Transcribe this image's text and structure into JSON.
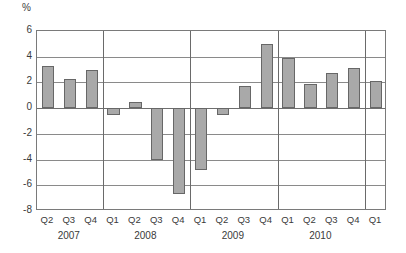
{
  "chart_data": {
    "type": "bar",
    "title": "",
    "subtitle": "",
    "xlabel": "",
    "ylabel": "%",
    "unit_label": "%",
    "ylim": [
      -8,
      6
    ],
    "ytick_step": 2,
    "yticks": [
      "6",
      "4",
      "2",
      "0",
      "-2",
      "-4",
      "-6",
      "-8"
    ],
    "ytick_values": [
      6,
      4,
      2,
      0,
      -2,
      -4,
      -6,
      -8
    ],
    "grid": true,
    "legend": "none",
    "categories": [
      "Q2",
      "Q3",
      "Q4",
      "Q1",
      "Q2",
      "Q3",
      "Q4",
      "Q1",
      "Q2",
      "Q3",
      "Q4",
      "Q1",
      "Q2",
      "Q3",
      "Q4",
      "Q1"
    ],
    "values": [
      3.3,
      2.3,
      3.0,
      -0.5,
      0.5,
      -4.0,
      -6.7,
      -4.8,
      -0.5,
      1.7,
      5.0,
      3.9,
      1.9,
      2.7,
      3.1,
      2.1
    ],
    "group_labels": [
      "2007",
      "2008",
      "2009",
      "2010"
    ],
    "groups": [
      {
        "year": "2007",
        "quarters": [
          "Q2",
          "Q3",
          "Q4"
        ],
        "values": [
          3.3,
          2.3,
          3.0
        ]
      },
      {
        "year": "2008",
        "quarters": [
          "Q1",
          "Q2",
          "Q3",
          "Q4"
        ],
        "values": [
          -0.5,
          0.5,
          -4.0,
          -6.7
        ]
      },
      {
        "year": "2009",
        "quarters": [
          "Q1",
          "Q2",
          "Q3",
          "Q4"
        ],
        "values": [
          -4.8,
          -0.5,
          1.7,
          5.0
        ]
      },
      {
        "year": "2010",
        "quarters": [
          "Q1",
          "Q2",
          "Q3",
          "Q4"
        ],
        "values": [
          3.9,
          1.9,
          2.7,
          3.1
        ]
      },
      {
        "year": "",
        "quarters": [
          "Q1"
        ],
        "values": [
          2.1
        ]
      }
    ],
    "colors": {
      "bar_fill": "#a9a9a9",
      "bar_border": "#676767",
      "gridline": "#8a8a8a",
      "frame": "#7a7a7a",
      "separator": "#6a6a6a",
      "background": "#ffffff",
      "text": "#3a3a3a"
    }
  }
}
